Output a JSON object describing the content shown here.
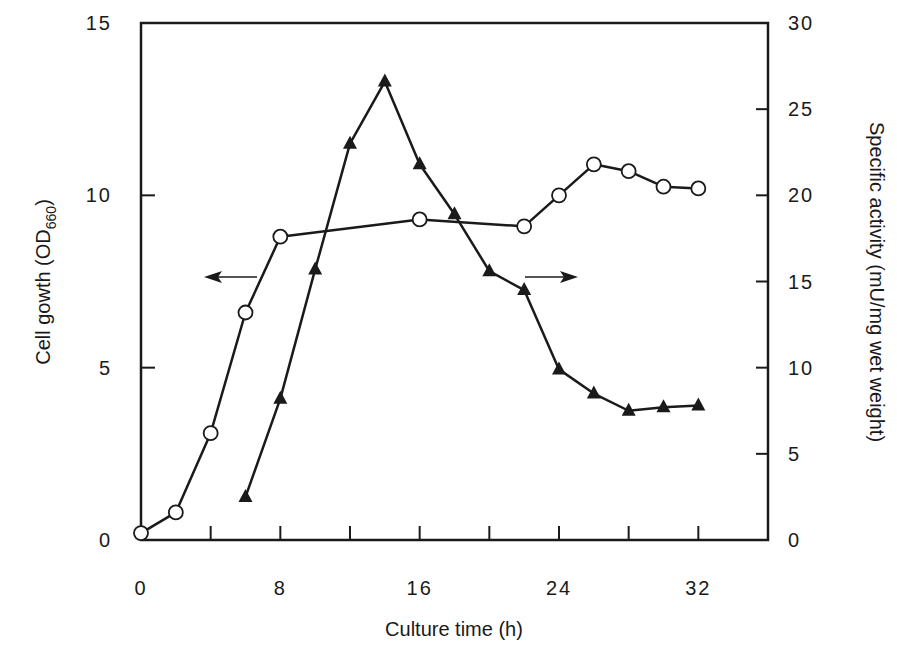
{
  "chart_data": {
    "type": "line",
    "title": "",
    "xlabel": "Culture time (h)",
    "ylabel": "Cell gowth (OD660)",
    "ylabel_main": "Cell gowth (OD",
    "ylabel_sub": "660",
    "ylabel_close": ")",
    "y2label": "Specific activity (mU/mg wet weight)",
    "xlim": [
      0,
      36
    ],
    "ylim": [
      0,
      15
    ],
    "y2lim": [
      0,
      30
    ],
    "x_ticks": [
      0,
      4,
      8,
      12,
      16,
      20,
      24,
      28,
      32
    ],
    "x_tick_labels": [
      "0",
      "8",
      "16",
      "24",
      "32"
    ],
    "x_tick_label_values": [
      0,
      8,
      16,
      24,
      32
    ],
    "y_ticks": [
      0,
      5,
      10,
      15
    ],
    "y_tick_labels": [
      "0",
      "5",
      "10",
      "15"
    ],
    "y2_ticks": [
      0,
      5,
      10,
      15,
      20,
      25,
      30
    ],
    "y2_tick_labels": [
      "0",
      "5",
      "10",
      "15",
      "20",
      "25",
      "30"
    ],
    "grid": false,
    "legend": null,
    "annotations": [
      {
        "type": "arrow",
        "direction": "left",
        "meaning": "open circles read on left axis (cell growth)"
      },
      {
        "type": "arrow",
        "direction": "right",
        "meaning": "filled triangles read on right axis (specific activity)"
      }
    ],
    "series": [
      {
        "name": "Cell growth (OD660)",
        "axis": "left",
        "marker": "open-circle",
        "x": [
          0,
          2,
          4,
          6,
          8,
          16,
          22,
          24,
          26,
          28,
          30,
          32
        ],
        "values": [
          0.2,
          0.8,
          3.1,
          6.6,
          8.8,
          9.3,
          9.1,
          10.0,
          10.9,
          10.7,
          10.25,
          10.2
        ]
      },
      {
        "name": "Specific activity (mU/mg wet weight)",
        "axis": "right",
        "marker": "filled-triangle",
        "x": [
          6,
          8,
          10,
          12,
          14,
          16,
          18,
          20,
          22,
          24,
          26,
          28,
          30,
          32
        ],
        "values": [
          2.5,
          8.2,
          15.7,
          23.0,
          26.6,
          21.8,
          18.9,
          15.6,
          14.5,
          9.9,
          8.5,
          7.5,
          7.7,
          7.8
        ]
      }
    ]
  }
}
